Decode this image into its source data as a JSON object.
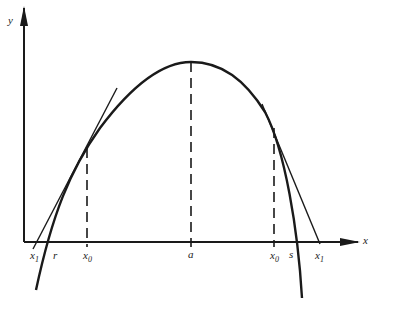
{
  "diagram": {
    "axes": {
      "x_label": "x",
      "y_label": "y"
    },
    "labels": {
      "x1_left": "x",
      "x1_left_sub": "1",
      "r": "r",
      "x0_left": "x",
      "x0_left_sub": "0",
      "a": "a",
      "x0_right": "x",
      "x0_right_sub": "0",
      "s": "s",
      "x1_right": "x",
      "x1_right_sub": "1"
    },
    "colors": {
      "ink": "#1a1a1a",
      "background": "#ffffff"
    }
  }
}
